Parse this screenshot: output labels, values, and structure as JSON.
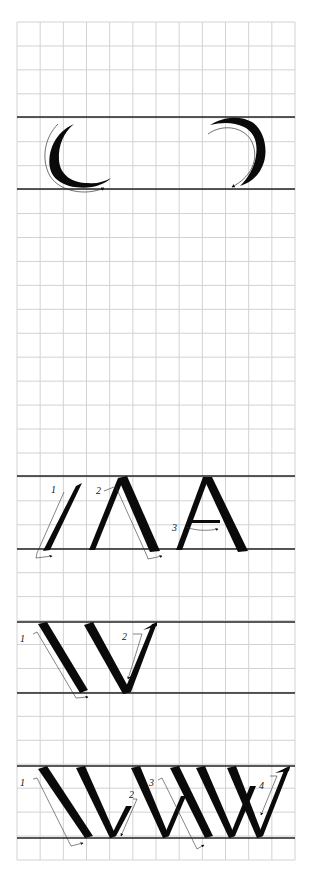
{
  "sheet": {
    "title": "Calligraphy stroke practice sheet",
    "background": "#ffffff",
    "grid_color": "#d2d2d2",
    "guide_color": "#222222",
    "ink_color": "#0a0a0a",
    "grid": {
      "x0": 17,
      "x1": 295,
      "y0": 22,
      "y1": 860,
      "columns": 12,
      "rows": 35
    }
  },
  "sections": [
    {
      "name": "round-strokes",
      "top_line": 117,
      "base_line": 189,
      "glyphs": [
        "left-arc",
        "right-arc"
      ]
    },
    {
      "name": "letter-a",
      "top_line": 476,
      "base_line": 549,
      "stroke_labels": [
        "1",
        "2",
        "3"
      ]
    },
    {
      "name": "letter-v",
      "top_line": 622,
      "base_line": 693,
      "stroke_labels": [
        "1",
        "2"
      ]
    },
    {
      "name": "letter-w",
      "top_line": 766,
      "base_line": 838,
      "stroke_labels": [
        "1",
        "2",
        "3",
        "4"
      ]
    }
  ],
  "labels": {
    "a1": "1",
    "a2": "2",
    "a3": "3",
    "v1": "1",
    "v2": "2",
    "w1": "1",
    "w2": "2",
    "w3": "3",
    "w4": "4"
  }
}
